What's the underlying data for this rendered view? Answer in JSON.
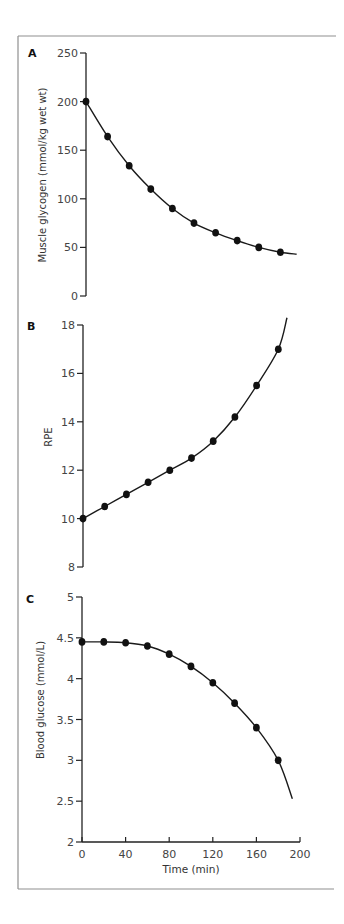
{
  "chart_data": [
    {
      "type": "scatter",
      "panel": "A",
      "title": "",
      "xlabel": "",
      "ylabel": "Muscle glycogen (mmol/kg wet wt)",
      "xlim": [
        0,
        200
      ],
      "ylim": [
        0,
        250
      ],
      "yticks": [
        0,
        50,
        100,
        150,
        200,
        250
      ],
      "ytick_labels": [
        "0",
        "50",
        "100",
        "150",
        "200",
        "250"
      ],
      "grid": false,
      "x": [
        0,
        20,
        40,
        60,
        80,
        100,
        120,
        140,
        160,
        180
      ],
      "series": [
        {
          "name": "Muscle glycogen",
          "values": [
            200,
            164,
            134,
            110,
            90,
            75,
            65,
            57,
            50,
            45
          ]
        }
      ],
      "fit_curve": {
        "shape": "exponential decay",
        "x_end": 195,
        "y_end": 43
      }
    },
    {
      "type": "scatter",
      "panel": "B",
      "title": "",
      "xlabel": "",
      "ylabel": "RPE",
      "xlim": [
        0,
        200
      ],
      "ylim": [
        8,
        18
      ],
      "yticks": [
        8,
        10,
        12,
        14,
        16,
        18
      ],
      "ytick_labels": [
        "8",
        "10",
        "12",
        "14",
        "16",
        "18"
      ],
      "grid": false,
      "x": [
        0,
        20,
        40,
        60,
        80,
        100,
        120,
        140,
        160,
        180
      ],
      "series": [
        {
          "name": "RPE",
          "values": [
            10,
            10.5,
            11,
            11.5,
            12,
            12.5,
            13.2,
            14.2,
            15.5,
            17
          ]
        }
      ],
      "fit_curve": {
        "shape": "exponential rise",
        "x_end": 188,
        "y_end": 18.3
      }
    },
    {
      "type": "scatter",
      "panel": "C",
      "title": "",
      "xlabel": "Time (min)",
      "ylabel": "Blood glucose (mmol/L)",
      "xlim": [
        0,
        200
      ],
      "ylim": [
        2,
        5
      ],
      "xticks": [
        0,
        40,
        80,
        120,
        160,
        200
      ],
      "xtick_labels": [
        "0",
        "40",
        "80",
        "120",
        "160",
        "200"
      ],
      "yticks": [
        2,
        2.5,
        3,
        3.5,
        4,
        4.5,
        5
      ],
      "ytick_labels": [
        "2",
        "2.5",
        "3",
        "3.5",
        "4",
        "4.5",
        "5"
      ],
      "grid": false,
      "x": [
        0,
        20,
        40,
        60,
        80,
        100,
        120,
        140,
        160,
        180
      ],
      "series": [
        {
          "name": "Blood glucose",
          "values": [
            4.45,
            4.45,
            4.44,
            4.4,
            4.3,
            4.15,
            3.95,
            3.7,
            3.4,
            3.0
          ]
        }
      ],
      "fit_curve": {
        "shape": "accelerating decline",
        "x_end": 193,
        "y_end": 2.53
      }
    }
  ]
}
